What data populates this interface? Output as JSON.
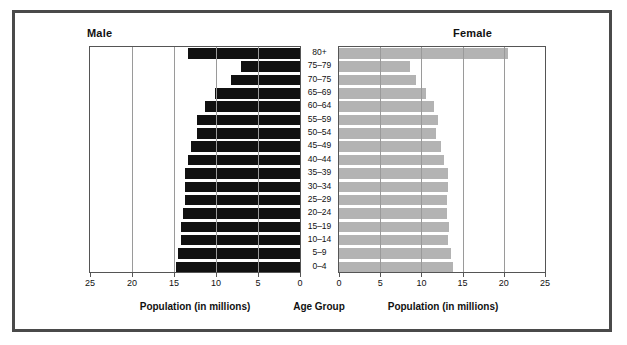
{
  "figure": {
    "male_label": "Male",
    "female_label": "Female",
    "age_axis_caption": "Age Group",
    "left_axis_caption": "Population (in millions)",
    "right_axis_caption": "Population (in millions)",
    "colors": {
      "male_bar": "#111111",
      "female_bar": "#b3b3b3",
      "frame": "#4a4a4a",
      "gridline": "#9a9a9a",
      "axis": "#555555"
    }
  },
  "chart_data": {
    "type": "bar",
    "subtype": "population-pyramid",
    "title": "",
    "xlabel": "Population (in millions)",
    "ylabel": "Age Group",
    "categories": [
      "80+",
      "75–79",
      "70–75",
      "65–69",
      "60–64",
      "55–59",
      "50–54",
      "45–49",
      "40–44",
      "35–39",
      "30–34",
      "25–29",
      "20–24",
      "15–19",
      "10–14",
      "5–9",
      "0–4"
    ],
    "series": [
      {
        "name": "Male",
        "side": "left",
        "color": "#111111",
        "values": [
          13.3,
          7.0,
          8.2,
          10.1,
          11.3,
          12.3,
          12.3,
          13.0,
          13.3,
          13.7,
          13.7,
          13.7,
          13.9,
          14.2,
          14.2,
          14.5,
          14.8
        ]
      },
      {
        "name": "Female",
        "side": "right",
        "color": "#b3b3b3",
        "values": [
          20.5,
          8.6,
          9.4,
          10.6,
          11.5,
          12.0,
          11.8,
          12.4,
          12.7,
          13.2,
          13.2,
          13.1,
          13.1,
          13.3,
          13.2,
          13.6,
          13.8
        ]
      }
    ],
    "xlim_left": [
      0,
      25
    ],
    "xlim_right": [
      0,
      25
    ],
    "left_ticks": [
      25,
      20,
      15,
      10,
      5,
      0
    ],
    "right_ticks": [
      0,
      5,
      10,
      15,
      20,
      25
    ],
    "grid": true,
    "grid_axis": "x",
    "legend": false
  }
}
